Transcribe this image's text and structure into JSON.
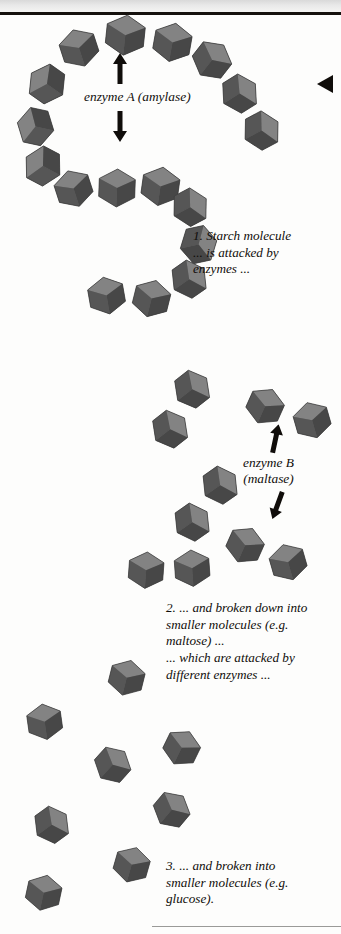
{
  "figure": {
    "domain": "scientific-diagram",
    "background_color": "#fdfdfc",
    "molecule_color": "#6b6b6b",
    "ink_color": "#100d0a",
    "page_marker": "left-pointing-triangle"
  },
  "labels": {
    "enzyme_a": "enzyme A (amylase)",
    "enzyme_b_line1": "enzyme B",
    "enzyme_b_line2": "(maltase)"
  },
  "captions": {
    "step1": "1. Starch molecule\n... is attacked by\nenzymes ...",
    "step2": "2. ... and broken down into\nsmaller molecules (e.g.\nmaltose) ...\n... which are attacked by\ndifferent enzymes ...",
    "step3": "3. ... and broken into\nsmaller molecules (e.g.\nglucose)."
  },
  "arrows": {
    "enzyme_a_up": "arrow-up",
    "enzyme_a_down": "arrow-down",
    "enzyme_b_up": "arrow-up",
    "enzyme_b_down": "arrow-down-right"
  },
  "chart_data": {
    "type": "diagram",
    "stages": [
      {
        "index": 1,
        "name": "Starch molecule",
        "enzyme": "enzyme A (amylase)",
        "unit_count": 17,
        "arrangement": "S-shaped linked chain"
      },
      {
        "index": 2,
        "name": "Maltose",
        "enzyme": "enzyme B (maltase)",
        "unit_count": 10,
        "arrangement": "5 free pairs of two linked units"
      },
      {
        "index": 3,
        "name": "Glucose",
        "enzyme": null,
        "unit_count": 8,
        "arrangement": "scattered single units"
      }
    ],
    "starch_chain": [
      {
        "x": 79,
        "y": 48,
        "r": -18,
        "s": 1.0
      },
      {
        "x": 125,
        "y": 35,
        "r": 6,
        "s": 1.06
      },
      {
        "x": 172,
        "y": 42,
        "r": 10,
        "s": 1.02
      },
      {
        "x": 212,
        "y": 60,
        "r": 38,
        "s": 1.0
      },
      {
        "x": 240,
        "y": 94,
        "r": 58,
        "s": 0.98
      },
      {
        "x": 262,
        "y": 131,
        "r": 62,
        "s": 0.98
      },
      {
        "x": 47,
        "y": 84,
        "r": -55,
        "s": 1.0
      },
      {
        "x": 36,
        "y": 127,
        "r": -78,
        "s": 0.98
      },
      {
        "x": 43,
        "y": 166,
        "r": -62,
        "s": 1.0
      },
      {
        "x": 74,
        "y": 189,
        "r": -18,
        "s": 0.98
      },
      {
        "x": 117,
        "y": 188,
        "r": 2,
        "s": 1.0
      },
      {
        "x": 160,
        "y": 186,
        "r": 8,
        "s": 1.02
      },
      {
        "x": 190,
        "y": 207,
        "r": 62,
        "s": 0.96
      },
      {
        "x": 199,
        "y": 245,
        "r": 78,
        "s": 0.98
      },
      {
        "x": 189,
        "y": 279,
        "r": 55,
        "s": 0.96
      },
      {
        "x": 152,
        "y": 299,
        "r": 14,
        "s": 0.98
      },
      {
        "x": 107,
        "y": 296,
        "r": -10,
        "s": 0.98
      }
    ],
    "maltose_pairs": [
      {
        "a": {
          "x": 192,
          "y": 389,
          "r": 52
        },
        "b": {
          "x": 170,
          "y": 429,
          "r": 52
        }
      },
      {
        "a": {
          "x": 265,
          "y": 406,
          "r": 24
        },
        "b": {
          "x": 312,
          "y": 420,
          "r": -16
        }
      },
      {
        "a": {
          "x": 220,
          "y": 485,
          "r": 55
        },
        "b": {
          "x": 192,
          "y": 522,
          "r": 55
        }
      },
      {
        "a": {
          "x": 245,
          "y": 545,
          "r": 24
        },
        "b": {
          "x": 288,
          "y": 562,
          "r": -16
        }
      },
      {
        "a": {
          "x": 146,
          "y": 570,
          "r": 4
        },
        "b": {
          "x": 192,
          "y": 568,
          "r": -4
        }
      }
    ],
    "glucose_units": [
      {
        "x": 127,
        "y": 678,
        "r": 14
      },
      {
        "x": 45,
        "y": 722,
        "r": -8
      },
      {
        "x": 182,
        "y": 748,
        "r": 26
      },
      {
        "x": 113,
        "y": 765,
        "r": 42
      },
      {
        "x": 172,
        "y": 810,
        "r": 40
      },
      {
        "x": 52,
        "y": 825,
        "r": 54
      },
      {
        "x": 132,
        "y": 865,
        "r": 16
      },
      {
        "x": 44,
        "y": 893,
        "r": 12
      }
    ]
  }
}
